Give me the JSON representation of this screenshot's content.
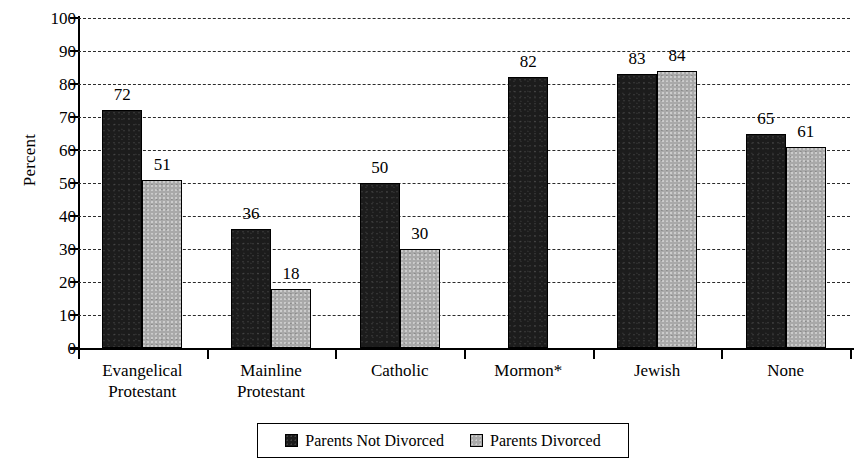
{
  "chart_data": {
    "type": "bar",
    "title": "",
    "xlabel": "",
    "ylabel": "Percent",
    "ylim": [
      0,
      100
    ],
    "ytick_step": 10,
    "yticks": [
      100,
      90,
      80,
      70,
      60,
      50,
      40,
      30,
      20,
      10,
      0
    ],
    "grid": true,
    "legend_position": "bottom",
    "categories": [
      "Evangelical Protestant",
      "Mainline Protestant",
      "Catholic",
      "Mormon*",
      "Jewish",
      "None"
    ],
    "series": [
      {
        "name": "Parents Not Divorced",
        "color": "#1c1c1c",
        "values": [
          72,
          36,
          50,
          82,
          83,
          65
        ]
      },
      {
        "name": "Parents Divorced",
        "color": "#a9a9a9",
        "values": [
          51,
          18,
          30,
          null,
          84,
          61
        ]
      }
    ]
  },
  "axis": {
    "y_title": "Percent",
    "y_ticks": [
      "100",
      "90",
      "80",
      "70",
      "60",
      "50",
      "40",
      "30",
      "20",
      "10",
      "0"
    ]
  },
  "categories": [
    {
      "lines": [
        "Evangelical",
        "Protestant"
      ]
    },
    {
      "lines": [
        "Mainline",
        "Protestant"
      ]
    },
    {
      "lines": [
        "Catholic"
      ]
    },
    {
      "lines": [
        "Mormon*"
      ]
    },
    {
      "lines": [
        "Jewish"
      ]
    },
    {
      "lines": [
        "None"
      ]
    }
  ],
  "groups": [
    {
      "name": "Evangelical Protestant",
      "bars": [
        {
          "series": "not-divorced",
          "value": 72,
          "label": "72"
        },
        {
          "series": "divorced",
          "value": 51,
          "label": "51"
        }
      ]
    },
    {
      "name": "Mainline Protestant",
      "bars": [
        {
          "series": "not-divorced",
          "value": 36,
          "label": "36"
        },
        {
          "series": "divorced",
          "value": 18,
          "label": "18"
        }
      ]
    },
    {
      "name": "Catholic",
      "bars": [
        {
          "series": "not-divorced",
          "value": 50,
          "label": "50"
        },
        {
          "series": "divorced",
          "value": 30,
          "label": "30"
        }
      ]
    },
    {
      "name": "Mormon",
      "bars": [
        {
          "series": "not-divorced",
          "value": 82,
          "label": "82"
        }
      ]
    },
    {
      "name": "Jewish",
      "bars": [
        {
          "series": "not-divorced",
          "value": 83,
          "label": "83"
        },
        {
          "series": "divorced",
          "value": 84,
          "label": "84"
        }
      ]
    },
    {
      "name": "None",
      "bars": [
        {
          "series": "not-divorced",
          "value": 65,
          "label": "65"
        },
        {
          "series": "divorced",
          "value": 61,
          "label": "61"
        }
      ]
    }
  ],
  "legend": {
    "items": [
      {
        "label": "Parents Not Divorced",
        "swatch": "dark"
      },
      {
        "label": "Parents Divorced",
        "swatch": "light"
      }
    ]
  }
}
